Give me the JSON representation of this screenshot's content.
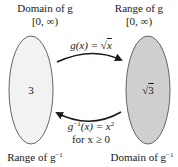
{
  "domain_set": {
    "title": "Domain of g",
    "interval": "[0, ∞)",
    "value": "3",
    "bottom_label": "Range of g",
    "bottom_label_sup": "−1",
    "fill": "#f2f2f2"
  },
  "range_set": {
    "title": "Range of g",
    "interval": "[0, ∞)",
    "value": "3",
    "value_prefix": "√",
    "bottom_label": "Domain of g",
    "bottom_label_sup": "−1",
    "fill": "#cfcfcf"
  },
  "forward_map": {
    "label_func": "g(x) = ",
    "label_root": "√",
    "label_var": "x"
  },
  "inverse_map": {
    "label_func": "g",
    "label_sup": "−1",
    "label_rest": "(x) = x",
    "label_pow": "2",
    "condition": "for x ≥ 0"
  }
}
